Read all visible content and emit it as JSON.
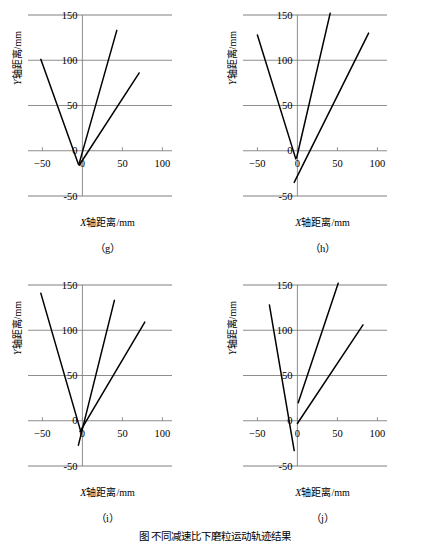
{
  "figure": {
    "caption": "图    不同减速比下磨粒运动轨迹结果",
    "axis": {
      "xlabel_var": "X",
      "xlabel_rest": "轴距离/mm",
      "ylabel_var": "Y",
      "ylabel_rest": "轴距离/mm",
      "xticks": [
        -50,
        0,
        50,
        100
      ],
      "yticks": [
        -50,
        0,
        50,
        100,
        150
      ],
      "xlim": [
        -75,
        112
      ],
      "ylim": [
        -62,
        162
      ],
      "grid": true,
      "gridcolor": "#808080",
      "linecolor": "#000000"
    }
  },
  "chart_data": [
    {
      "type": "line",
      "panel": "(g)",
      "title": "",
      "xlabel": "X轴距离/mm",
      "ylabel": "Y轴距离/mm",
      "xlim": [
        -75,
        112
      ],
      "ylim": [
        -62,
        162
      ],
      "xticks": [
        -50,
        0,
        50,
        100
      ],
      "yticks": [
        -50,
        0,
        50,
        100,
        150
      ],
      "grid": true,
      "series": [
        {
          "name": "trajectory-1",
          "x": [
            -52,
            -5
          ],
          "y": [
            101,
            -15
          ]
        },
        {
          "name": "trajectory-2",
          "x": [
            -4,
            43
          ],
          "y": [
            -14,
            133
          ]
        },
        {
          "name": "trajectory-3",
          "x": [
            -4,
            71
          ],
          "y": [
            -16,
            86
          ]
        }
      ]
    },
    {
      "type": "line",
      "panel": "(h)",
      "title": "",
      "xlabel": "X轴距离/mm",
      "ylabel": "Y轴距离/mm",
      "xlim": [
        -75,
        112
      ],
      "ylim": [
        -62,
        162
      ],
      "xticks": [
        -50,
        0,
        50,
        100
      ],
      "yticks": [
        -50,
        0,
        50,
        100,
        150
      ],
      "grid": true,
      "series": [
        {
          "name": "trajectory-1",
          "x": [
            -50,
            -2
          ],
          "y": [
            128,
            -9
          ]
        },
        {
          "name": "trajectory-2",
          "x": [
            -1,
            41
          ],
          "y": [
            -8,
            152
          ]
        },
        {
          "name": "trajectory-3",
          "x": [
            -4,
            89
          ],
          "y": [
            -35,
            130
          ]
        }
      ]
    },
    {
      "type": "line",
      "panel": "(i)",
      "title": "",
      "xlabel": "X轴距离/mm",
      "ylabel": "Y轴距离/mm",
      "xlim": [
        -75,
        112
      ],
      "ylim": [
        -62,
        162
      ],
      "xticks": [
        -50,
        0,
        50,
        100
      ],
      "yticks": [
        -50,
        0,
        50,
        100,
        150
      ],
      "grid": true,
      "series": [
        {
          "name": "trajectory-1",
          "x": [
            -52,
            -2
          ],
          "y": [
            141,
            -12
          ]
        },
        {
          "name": "trajectory-2",
          "x": [
            -5,
            40
          ],
          "y": [
            -27,
            133
          ]
        },
        {
          "name": "trajectory-3",
          "x": [
            -3,
            78
          ],
          "y": [
            -12,
            109
          ]
        }
      ]
    },
    {
      "type": "line",
      "panel": "(j)",
      "title": "",
      "xlabel": "X轴距离/mm",
      "ylabel": "Y轴距离/mm",
      "xlim": [
        -75,
        112
      ],
      "ylim": [
        -62,
        162
      ],
      "xticks": [
        -50,
        0,
        50,
        100
      ],
      "yticks": [
        -50,
        0,
        50,
        100,
        150
      ],
      "grid": true,
      "series": [
        {
          "name": "trajectory-1",
          "x": [
            -35,
            -4
          ],
          "y": [
            128,
            -33
          ]
        },
        {
          "name": "trajectory-2",
          "x": [
            1,
            51
          ],
          "y": [
            20,
            152
          ]
        },
        {
          "name": "trajectory-3",
          "x": [
            0,
            82
          ],
          "y": [
            -3,
            106
          ]
        }
      ]
    }
  ],
  "panels": [
    {
      "id": "g",
      "caption": "（g）"
    },
    {
      "id": "h",
      "caption": "（h）"
    },
    {
      "id": "i",
      "caption": "（i）"
    },
    {
      "id": "j",
      "caption": "（j）"
    }
  ]
}
